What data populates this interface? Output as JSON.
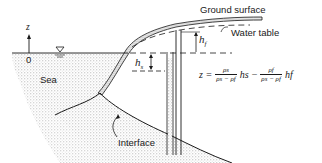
{
  "diagram": {
    "type": "saltwater-intrusion-cross-section",
    "labels": {
      "axis_z": "z",
      "origin": "0",
      "sea": "Sea",
      "ground_surface": "Ground surface",
      "water_table": "Water table",
      "h_f": "h",
      "h_f_sub": "f",
      "h_s": "h",
      "h_s_sub": "s",
      "interface": "Interface"
    },
    "formula": {
      "lhs": "z =",
      "frac1_num": "ρs",
      "frac1_den": "ρs − ρf",
      "term1": "hs",
      "minus": "−",
      "frac2_num": "ρf",
      "frac2_den": "ρs − ρf",
      "term2": "hf"
    },
    "colors": {
      "ink": "#1a1a1a",
      "stipple": "#b8b8b8",
      "background": "#ffffff"
    }
  }
}
